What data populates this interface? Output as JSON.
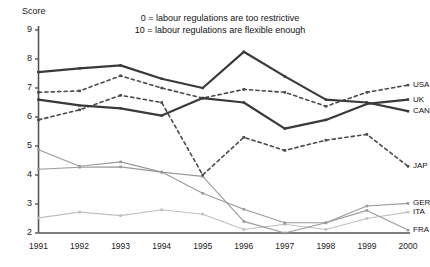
{
  "chart_data": {
    "type": "line",
    "title": "",
    "xlabel": "",
    "ylabel": "Score",
    "ylim": [
      2,
      9
    ],
    "yticks": [
      2,
      3,
      4,
      5,
      6,
      7,
      8,
      9
    ],
    "grid": false,
    "legend_position": "right-inline",
    "annotations": [
      "0 = labour regulations are too restrictive",
      "10 = labour regulations are flexible enough"
    ],
    "categories": [
      "1991",
      "1992",
      "1993",
      "1994",
      "1995",
      "1996",
      "1997",
      "1998",
      "1999",
      "2000"
    ],
    "series": [
      {
        "name": "CAN",
        "label": "CAN",
        "color": "#3a3a3a",
        "style": "solid",
        "width": 2.2,
        "values": [
          7.55,
          7.68,
          7.78,
          7.32,
          7.0,
          8.25,
          7.4,
          6.6,
          6.5,
          6.2
        ]
      },
      {
        "name": "UK",
        "label": "UK",
        "color": "#3a3a3a",
        "style": "solid",
        "width": 2.2,
        "values": [
          6.6,
          6.4,
          6.3,
          6.05,
          6.65,
          6.5,
          5.6,
          5.9,
          6.45,
          6.6
        ]
      },
      {
        "name": "USA",
        "label": "USA",
        "color": "#4a4a4a",
        "style": "dashed",
        "width": 1.6,
        "values": [
          6.85,
          6.9,
          7.42,
          7.0,
          6.65,
          6.95,
          6.85,
          6.37,
          6.85,
          7.1
        ]
      },
      {
        "name": "JAP",
        "label": "JAP",
        "color": "#4a4a4a",
        "style": "dashed",
        "width": 1.6,
        "values": [
          5.9,
          6.25,
          6.75,
          6.5,
          4.0,
          5.3,
          4.85,
          5.2,
          5.4,
          4.3
        ]
      },
      {
        "name": "GER",
        "label": "GER",
        "color": "#9a9a9a",
        "style": "solid",
        "width": 1.1,
        "values": [
          4.2,
          4.27,
          4.28,
          4.1,
          3.37,
          2.82,
          2.35,
          2.35,
          2.93,
          3.02
        ]
      },
      {
        "name": "ITA",
        "label": "ITA",
        "color": "#c0c0c0",
        "style": "solid",
        "width": 1.1,
        "values": [
          2.52,
          2.72,
          2.6,
          2.8,
          2.65,
          2.12,
          2.3,
          2.12,
          2.5,
          2.72
        ]
      },
      {
        "name": "FRA",
        "label": "FRA",
        "color": "#9a9a9a",
        "style": "solid",
        "width": 1.1,
        "values": [
          4.87,
          4.3,
          4.45,
          4.1,
          3.95,
          2.4,
          2.0,
          2.35,
          2.78,
          2.1
        ]
      }
    ]
  },
  "axis": {
    "y_title": "Score",
    "y_ticks": [
      "9",
      "8",
      "7",
      "6",
      "5",
      "4",
      "3",
      "2"
    ],
    "x_ticks": [
      "1991",
      "1992",
      "1993",
      "1994",
      "1995",
      "1996",
      "1997",
      "1998",
      "1999",
      "2000"
    ]
  },
  "annotations": {
    "line1": "0 = labour regulations are too restrictive",
    "line2": "10 = labour regulations are flexible enough"
  },
  "colors": {
    "axis": "#555555",
    "text": "#111111",
    "dark_series": "#3a3a3a",
    "mid_series": "#9a9a9a",
    "light_series": "#c0c0c0"
  }
}
